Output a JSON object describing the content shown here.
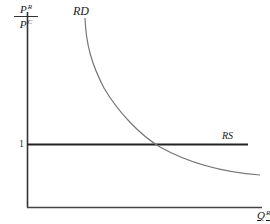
{
  "diagram": {
    "title": "",
    "y_axis": {
      "label_numerator": "P",
      "label_numerator_sup": "R",
      "label_denominator": "P",
      "label_denominator_sup": "C",
      "tick_label": "1"
    },
    "x_axis": {
      "label": "Q",
      "label_sup": "R"
    },
    "curves": [
      {
        "name": "RD",
        "label": "RD",
        "type": "downward-sloping convex curve",
        "color": "#777777"
      },
      {
        "name": "RS",
        "label": "RS",
        "type": "horizontal line at 1",
        "color": "#222222"
      }
    ],
    "colors": {
      "axes": "#333333",
      "rs_line": "#222222",
      "rd_curve": "#777777"
    }
  }
}
